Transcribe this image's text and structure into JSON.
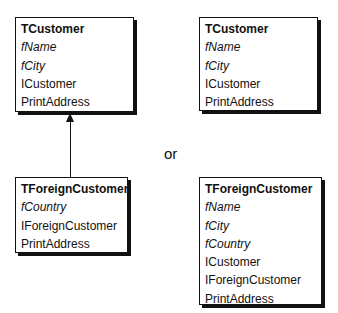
{
  "diagram": {
    "left": {
      "base_class": {
        "name": "TCustomer",
        "fields": [
          "fName",
          "fCity"
        ],
        "members": [
          "ICustomer",
          "PrintAddress"
        ]
      },
      "derived_class": {
        "name": "TForeignCustomer",
        "fields": [
          "fCountry"
        ],
        "members": [
          "IForeignCustomer",
          "PrintAddress"
        ]
      },
      "relation": "inheritance-arrow"
    },
    "separator": "or",
    "right": {
      "base_class": {
        "name": "TCustomer",
        "fields": [
          "fName",
          "fCity"
        ],
        "members": [
          "ICustomer",
          "PrintAddress"
        ]
      },
      "flattened_class": {
        "name": "TForeignCustomer",
        "fields": [
          "fName",
          "fCity",
          "fCountry"
        ],
        "members": [
          "ICustomer",
          "IForeignCustomer",
          "PrintAddress"
        ]
      }
    },
    "colors": {
      "line": "#111111",
      "background": "#ffffff"
    }
  }
}
